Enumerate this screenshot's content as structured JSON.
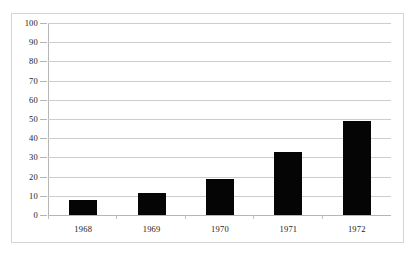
{
  "chart_data": {
    "type": "bar",
    "title": "",
    "subtitle": "",
    "xlabel": "",
    "ylabel": "",
    "categories": [
      "1968",
      "1969",
      "1970",
      "1971",
      "1972"
    ],
    "values": [
      8,
      11.5,
      19,
      33,
      49
    ],
    "series": [
      {
        "name": "",
        "values": [
          8,
          11.5,
          19,
          33,
          49
        ]
      }
    ],
    "ylim": [
      0,
      100
    ],
    "ytick_labels": [
      "0",
      "10",
      "20",
      "30",
      "40",
      "50",
      "60",
      "70",
      "80",
      "90",
      "100"
    ],
    "ytick_values": [
      0,
      10,
      20,
      30,
      40,
      50,
      60,
      70,
      80,
      90,
      100
    ],
    "grid": true,
    "grid_axis": "y",
    "legend": false,
    "legend_position": "none",
    "annotations": [],
    "colors": {
      "bar": "#050505",
      "gridline": "#cdcdcd",
      "axis": "#b5b5b5",
      "border": "#d4d4d4",
      "background": "#ffffff",
      "text": "#222222"
    }
  }
}
